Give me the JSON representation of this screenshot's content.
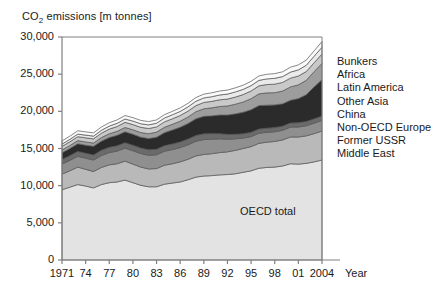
{
  "chart_data": {
    "type": "area",
    "title": "CO2 emissions [m tonnes]",
    "title_main": "CO",
    "title_sub": "2",
    "title_rest": " emissions [m tonnes]",
    "xlabel": "Year",
    "ylabel": "",
    "ylim": [
      0,
      30000
    ],
    "ytick_labels": [
      "30,000",
      "25,000",
      "20,000",
      "15,000",
      "10,000",
      "5,000",
      "0"
    ],
    "ytick_values": [
      30000,
      25000,
      20000,
      15000,
      10000,
      5000,
      0
    ],
    "xtick_labels": [
      "1971",
      "74",
      "77",
      "80",
      "83",
      "86",
      "89",
      "92",
      "95",
      "98",
      "01",
      "2004"
    ],
    "xtick_values": [
      1971,
      1974,
      1977,
      1980,
      1983,
      1986,
      1989,
      1992,
      1995,
      1998,
      2001,
      2004
    ],
    "x": [
      1971,
      1972,
      1973,
      1974,
      1975,
      1976,
      1977,
      1978,
      1979,
      1980,
      1981,
      1982,
      1983,
      1984,
      1985,
      1986,
      1987,
      1988,
      1989,
      1990,
      1991,
      1992,
      1993,
      1994,
      1995,
      1996,
      1997,
      1998,
      1999,
      2000,
      2001,
      2002,
      2003,
      2004
    ],
    "grid": false,
    "legend_position": "right-outside",
    "stack_order_bottom_to_top": [
      "OECD total",
      "Middle East",
      "Former USSR",
      "Non-OECD Europe",
      "China",
      "Other Asia",
      "Latin America",
      "Africa",
      "Bunkers"
    ],
    "inline_labels": [
      {
        "text": "OECD total",
        "series": "OECD total"
      }
    ],
    "legend": [
      "Bunkers",
      "Africa",
      "Latin America",
      "Other Asia",
      "China",
      "Non-OECD Europe",
      "Former USSR",
      "Middle East"
    ],
    "series": [
      {
        "name": "OECD total",
        "color": "#e3e3e3",
        "values": [
          9450,
          9800,
          10150,
          9950,
          9700,
          10150,
          10400,
          10500,
          10750,
          10400,
          10050,
          9850,
          9850,
          10200,
          10350,
          10500,
          10800,
          11150,
          11300,
          11350,
          11450,
          11500,
          11600,
          11800,
          12000,
          12350,
          12450,
          12500,
          12650,
          12950,
          12900,
          13000,
          13200,
          13450
        ]
      },
      {
        "name": "Middle East",
        "color": "#b9b9b9",
        "values": [
          2100,
          2200,
          2350,
          2250,
          2200,
          2300,
          2400,
          2450,
          2550,
          2500,
          2450,
          2400,
          2450,
          2550,
          2600,
          2700,
          2750,
          2850,
          2900,
          2950,
          3000,
          3050,
          3150,
          3200,
          3250,
          3350,
          3400,
          3450,
          3500,
          3600,
          3650,
          3700,
          3800,
          3900
        ]
      },
      {
        "name": "Former USSR",
        "color": "#8f8f8f",
        "values": [
          1350,
          1400,
          1450,
          1500,
          1550,
          1600,
          1650,
          1700,
          1750,
          1800,
          1820,
          1830,
          1850,
          1880,
          1900,
          1920,
          1950,
          1980,
          2000,
          1950,
          1850,
          1700,
          1550,
          1400,
          1350,
          1350,
          1320,
          1300,
          1300,
          1320,
          1340,
          1360,
          1400,
          1430
        ]
      },
      {
        "name": "Non-OECD Europe",
        "color": "#6b6b6b",
        "values": [
          620,
          640,
          660,
          670,
          680,
          700,
          710,
          720,
          730,
          740,
          740,
          740,
          745,
          750,
          755,
          760,
          765,
          770,
          775,
          740,
          700,
          650,
          610,
          580,
          570,
          570,
          565,
          560,
          560,
          565,
          570,
          575,
          585,
          595
        ]
      },
      {
        "name": "China",
        "color": "#2b2b2b",
        "values": [
          900,
          960,
          1020,
          1080,
          1160,
          1240,
          1320,
          1400,
          1470,
          1480,
          1470,
          1520,
          1620,
          1750,
          1880,
          1980,
          2100,
          2250,
          2350,
          2400,
          2500,
          2600,
          2750,
          2900,
          3050,
          3150,
          3100,
          3050,
          3000,
          3050,
          3250,
          3600,
          4300,
          4900
        ]
      },
      {
        "name": "Other Asia",
        "color": "#9d9d9d",
        "values": [
          380,
          400,
          430,
          440,
          450,
          480,
          510,
          540,
          580,
          600,
          620,
          650,
          690,
          730,
          770,
          820,
          880,
          950,
          1020,
          1080,
          1150,
          1220,
          1300,
          1380,
          1480,
          1580,
          1650,
          1650,
          1720,
          1800,
          1860,
          1930,
          2050,
          2180
        ]
      },
      {
        "name": "Latin America",
        "color": "#c9c9c9",
        "values": [
          480,
          500,
          530,
          550,
          560,
          590,
          620,
          650,
          690,
          700,
          700,
          700,
          700,
          720,
          740,
          760,
          790,
          820,
          850,
          870,
          900,
          930,
          960,
          1000,
          1040,
          1080,
          1120,
          1150,
          1160,
          1180,
          1180,
          1180,
          1200,
          1260
        ]
      },
      {
        "name": "Africa",
        "color": "#eaeaea",
        "values": [
          320,
          330,
          350,
          360,
          370,
          390,
          410,
          430,
          450,
          470,
          480,
          490,
          500,
          520,
          540,
          550,
          570,
          590,
          610,
          630,
          650,
          670,
          690,
          700,
          720,
          740,
          760,
          780,
          790,
          810,
          830,
          850,
          880,
          910
        ]
      },
      {
        "name": "Bunkers",
        "color": "#fafafa",
        "values": [
          420,
          430,
          440,
          440,
          430,
          440,
          450,
          460,
          470,
          460,
          450,
          440,
          440,
          450,
          460,
          470,
          480,
          500,
          510,
          520,
          530,
          540,
          550,
          560,
          580,
          600,
          620,
          630,
          640,
          660,
          670,
          690,
          720,
          760
        ]
      }
    ]
  }
}
